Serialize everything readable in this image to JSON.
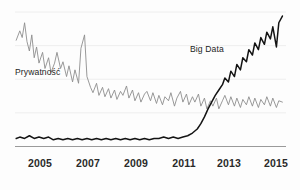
{
  "chart_data": {
    "type": "line",
    "title": "",
    "subtitle": "",
    "xlabel": "",
    "ylabel": "",
    "grid": true,
    "gridlines_y": [
      0,
      25,
      50,
      75,
      100
    ],
    "legend_position": "inline-annotation",
    "xlim": [
      2004.3,
      2015.6
    ],
    "ylim": [
      0,
      100
    ],
    "xticks": [
      2005,
      2007,
      2009,
      2011,
      2013,
      2015
    ],
    "xtick_labels": [
      "2005",
      "2007",
      "2009",
      "2011",
      "2013",
      "2015"
    ],
    "yticks": [],
    "ytick_labels": [],
    "annotations": [
      {
        "text": "Prywatność",
        "x": 2005.0,
        "y": 57,
        "series": "privacy"
      },
      {
        "text": "Big Data",
        "x": 2012.3,
        "y": 72,
        "series": "bigdata"
      }
    ],
    "series": [
      {
        "name": "Prywatność",
        "color": "#8d8d8d",
        "width": 0.9,
        "x": [
          2004.35,
          2004.5,
          2004.6,
          2004.7,
          2004.8,
          2004.9,
          2005.0,
          2005.1,
          2005.2,
          2005.3,
          2005.45,
          2005.55,
          2005.7,
          2005.8,
          2005.95,
          2006.05,
          2006.2,
          2006.3,
          2006.45,
          2006.55,
          2006.7,
          2006.8,
          2006.95,
          2007.05,
          2007.2,
          2007.3,
          2007.45,
          2007.55,
          2007.7,
          2007.8,
          2007.95,
          2008.05,
          2008.2,
          2008.3,
          2008.45,
          2008.55,
          2008.7,
          2008.8,
          2008.95,
          2009.05,
          2009.2,
          2009.3,
          2009.45,
          2009.55,
          2009.7,
          2009.8,
          2009.95,
          2010.05,
          2010.2,
          2010.3,
          2010.45,
          2010.55,
          2010.7,
          2010.8,
          2010.95,
          2011.05,
          2011.2,
          2011.3,
          2011.45,
          2011.55,
          2011.7,
          2011.8,
          2011.95,
          2012.05,
          2012.2,
          2012.3,
          2012.45,
          2012.55,
          2012.7,
          2012.8,
          2012.95,
          2013.05,
          2013.2,
          2013.3,
          2013.45,
          2013.55,
          2013.7,
          2013.8,
          2013.95,
          2014.05,
          2014.2,
          2014.3,
          2014.45,
          2014.55,
          2014.7,
          2014.8,
          2014.95,
          2015.05,
          2015.2,
          2015.3,
          2015.45
        ],
        "values": [
          79,
          86,
          81,
          92,
          78,
          71,
          83,
          66,
          74,
          62,
          70,
          58,
          66,
          55,
          62,
          70,
          58,
          63,
          52,
          60,
          48,
          57,
          47,
          73,
          83,
          52,
          44,
          40,
          47,
          38,
          44,
          37,
          43,
          36,
          42,
          35,
          41,
          38,
          45,
          36,
          42,
          34,
          40,
          33,
          39,
          41,
          34,
          40,
          32,
          38,
          31,
          37,
          34,
          40,
          30,
          36,
          41,
          33,
          39,
          31,
          37,
          33,
          39,
          30,
          36,
          28,
          34,
          30,
          36,
          28,
          34,
          38,
          31,
          37,
          30,
          36,
          29,
          35,
          31,
          37,
          30,
          36,
          29,
          35,
          31,
          37,
          30,
          36,
          29,
          34,
          33
        ]
      },
      {
        "name": "Big Data",
        "color": "#141414",
        "width": 1.5,
        "x": [
          2004.35,
          2004.5,
          2004.7,
          2004.9,
          2005.1,
          2005.3,
          2005.5,
          2005.7,
          2005.9,
          2006.1,
          2006.3,
          2006.5,
          2006.7,
          2006.9,
          2007.1,
          2007.3,
          2007.5,
          2007.7,
          2007.9,
          2008.1,
          2008.3,
          2008.5,
          2008.7,
          2008.9,
          2009.1,
          2009.3,
          2009.5,
          2009.7,
          2009.9,
          2010.1,
          2010.3,
          2010.5,
          2010.7,
          2010.9,
          2011.1,
          2011.3,
          2011.5,
          2011.7,
          2011.9,
          2012.05,
          2012.2,
          2012.35,
          2012.5,
          2012.65,
          2012.8,
          2012.95,
          2013.05,
          2013.2,
          2013.3,
          2013.45,
          2013.55,
          2013.7,
          2013.8,
          2013.95,
          2014.05,
          2014.2,
          2014.3,
          2014.45,
          2014.55,
          2014.7,
          2014.8,
          2014.95,
          2015.05,
          2015.2,
          2015.3,
          2015.45
        ],
        "values": [
          6,
          7,
          6,
          8,
          6,
          7,
          6,
          7,
          5,
          6,
          5,
          6,
          5,
          6,
          5,
          6,
          5,
          6,
          5,
          6,
          5,
          6,
          5,
          6,
          5,
          6,
          5,
          6,
          5,
          6,
          6,
          7,
          6,
          7,
          6,
          7,
          8,
          10,
          13,
          17,
          22,
          28,
          33,
          38,
          42,
          46,
          51,
          48,
          56,
          52,
          61,
          57,
          66,
          63,
          72,
          68,
          77,
          72,
          81,
          76,
          85,
          80,
          89,
          74,
          92,
          97
        ]
      }
    ]
  },
  "axis": {
    "baseline_color": "#9a9a9a",
    "gridline_color": "#eeeeee"
  },
  "labels": {
    "privacy": "Prywatność",
    "bigdata": "Big Data"
  },
  "ticks": {
    "t0": "2005",
    "t1": "2007",
    "t2": "2009",
    "t3": "2011",
    "t4": "2013",
    "t5": "2015"
  }
}
